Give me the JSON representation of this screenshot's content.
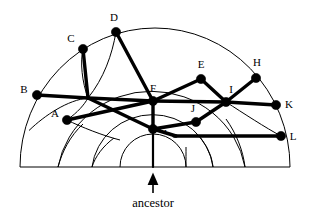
{
  "figure": {
    "caption": "ancestor",
    "type": "radial-genealogy-semicircle",
    "colors": {
      "ink": "#000000",
      "background": "#ffffff"
    },
    "center": {
      "x": 153,
      "y": 167
    },
    "baseline": {
      "x1": 20,
      "x2": 290,
      "y": 167
    },
    "arc_radii": [
      33,
      61,
      95,
      133
    ],
    "arc_radii_right": [
      33,
      60,
      92,
      137
    ],
    "arrow": {
      "x": 153,
      "tip_y": 172,
      "tail_y": 193
    },
    "nodes": [
      {
        "id": "A",
        "label": "A",
        "x": 67,
        "y": 120,
        "label_x": 55,
        "label_y": 117
      },
      {
        "id": "B",
        "label": "B",
        "x": 37,
        "y": 95,
        "label_x": 24,
        "label_y": 93
      },
      {
        "id": "C",
        "label": "C",
        "x": 83,
        "y": 49,
        "label_x": 71,
        "label_y": 42
      },
      {
        "id": "D",
        "label": "D",
        "x": 116,
        "y": 32,
        "label_x": 114,
        "label_y": 21
      },
      {
        "id": "E",
        "label": "E",
        "x": 201,
        "y": 79,
        "label_x": 201,
        "label_y": 68
      },
      {
        "id": "F",
        "label": "F",
        "x": 153,
        "y": 101,
        "label_x": 153,
        "label_y": 92
      },
      {
        "id": "G",
        "label": "G",
        "x": 153,
        "y": 129,
        "label_x": 161,
        "label_y": 129
      },
      {
        "id": "H",
        "label": "H",
        "x": 256,
        "y": 78,
        "label_x": 257,
        "label_y": 66
      },
      {
        "id": "I",
        "label": "I",
        "x": 226,
        "y": 102,
        "label_x": 229,
        "label_y": 93
      },
      {
        "id": "J",
        "label": "J",
        "x": 196,
        "y": 122,
        "label_x": 193,
        "label_y": 112
      },
      {
        "id": "K",
        "label": "K",
        "x": 276,
        "y": 105,
        "label_x": 288,
        "label_y": 105
      },
      {
        "id": "L",
        "label": "L",
        "x": 281,
        "y": 136,
        "label_x": 293,
        "label_y": 138
      }
    ],
    "internal_points": [
      {
        "id": "P1",
        "x": 88,
        "y": 98
      },
      {
        "id": "P2",
        "x": 153,
        "y": 167
      }
    ],
    "edges": [
      {
        "from": "B",
        "to": "P1"
      },
      {
        "from": "C",
        "to": "P1"
      },
      {
        "from": "P1",
        "to": "G"
      },
      {
        "from": "A",
        "to": "F"
      },
      {
        "from": "F",
        "to": "P1"
      },
      {
        "from": "D",
        "to": "F"
      },
      {
        "from": "F",
        "to": "G"
      },
      {
        "from": "F",
        "to": "E"
      },
      {
        "from": "E",
        "to": "I"
      },
      {
        "from": "F",
        "to": "I"
      },
      {
        "from": "I",
        "to": "H"
      },
      {
        "from": "I",
        "to": "K"
      },
      {
        "from": "G",
        "to": "J"
      },
      {
        "from": "J",
        "to": "I"
      },
      {
        "from": "G",
        "to": "L"
      },
      {
        "from": "G",
        "to": "P2"
      }
    ]
  }
}
